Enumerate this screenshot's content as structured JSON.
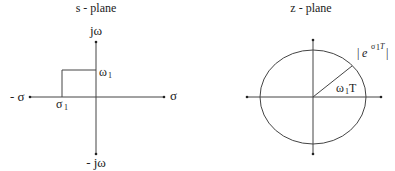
{
  "s_plane": {
    "title": "s - plane",
    "labels": {
      "j_omega": "jω",
      "neg_j_omega": "- jω",
      "sigma": "σ",
      "neg_sigma": "- σ",
      "omega1_base": "ω",
      "omega1_sub": "1",
      "sigma1_base": "σ",
      "sigma1_sub": "1"
    }
  },
  "z_plane": {
    "title": "z - plane",
    "labels": {
      "angle_base": "ω",
      "angle_sub": "1",
      "angle_suffix": "T",
      "radius_bar_left": "|",
      "radius_e": "e",
      "radius_exp_sigma": "σ",
      "radius_exp_sub": "1",
      "radius_exp_T": "T",
      "radius_bar_right": "|"
    }
  },
  "colors": {
    "line": "#444444",
    "text": "#222222",
    "background": "#ffffff"
  }
}
